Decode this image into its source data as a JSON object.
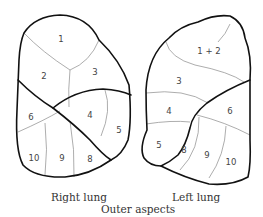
{
  "diagram": {
    "caption": "Outer aspects",
    "right_lung": {
      "label": "Right lung",
      "segments": [
        {
          "id": "1",
          "x": 61,
          "y": 39
        },
        {
          "id": "2",
          "x": 44,
          "y": 76
        },
        {
          "id": "3",
          "x": 95,
          "y": 72
        },
        {
          "id": "4",
          "x": 90,
          "y": 115
        },
        {
          "id": "5",
          "x": 119,
          "y": 130
        },
        {
          "id": "6",
          "x": 31,
          "y": 117
        },
        {
          "id": "10",
          "x": 34,
          "y": 158
        },
        {
          "id": "9",
          "x": 62,
          "y": 158
        },
        {
          "id": "8",
          "x": 90,
          "y": 159
        }
      ]
    },
    "left_lung": {
      "label": "Left lung",
      "segments": [
        {
          "id": "1 + 2",
          "x": 209,
          "y": 51
        },
        {
          "id": "3",
          "x": 179,
          "y": 81
        },
        {
          "id": "4",
          "x": 169,
          "y": 111
        },
        {
          "id": "6",
          "x": 230,
          "y": 111
        },
        {
          "id": "5",
          "x": 159,
          "y": 145
        },
        {
          "id": "8",
          "x": 184,
          "y": 150
        },
        {
          "id": "9",
          "x": 207,
          "y": 155
        },
        {
          "id": "10",
          "x": 231,
          "y": 162
        }
      ]
    }
  }
}
